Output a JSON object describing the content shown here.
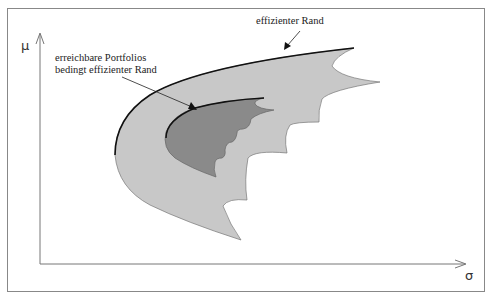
{
  "diagram": {
    "axes": {
      "y_label": "μ",
      "x_label": "σ"
    },
    "annotations": {
      "efficient_frontier": "effizienter Rand",
      "conditional_line1": "erreichbare Portfolios",
      "conditional_line2": "bedingt effizienter Rand"
    },
    "colors": {
      "outer_region": "#c8c8c8",
      "inner_region": "#8a8a8a",
      "frontier_line": "#111111",
      "frame": "#888888",
      "axis": "#777777"
    },
    "regions": [
      {
        "name": "erreichbare Portfolios (gesamt)",
        "shade": "light"
      },
      {
        "name": "erreichbare Portfolios (bedingt)",
        "shade": "dark"
      }
    ]
  }
}
